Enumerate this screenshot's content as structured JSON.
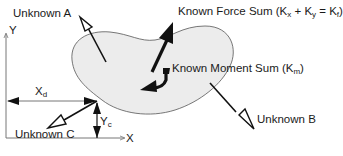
{
  "labels": {
    "unknown_a": "Unknown A",
    "unknown_b": "Unknown B",
    "unknown_c": "Unknown C",
    "known_force_prefix": "Known Force Sum (K",
    "known_force_sub_x": "x",
    "known_force_mid": " + K",
    "known_force_sub_y": "y",
    "known_force_eq": " = K",
    "known_force_sub_f": "f",
    "known_force_suffix": ")",
    "known_moment_prefix": "Known Moment Sum (K",
    "known_moment_sub": "m",
    "known_moment_suffix": ")",
    "x_axis": "X",
    "y_axis": "Y",
    "xd_main": "X",
    "xd_sub": "d",
    "yc_main": "Y",
    "yc_sub": "c"
  },
  "colors": {
    "body_fill": "#ececec",
    "stroke": "#111111",
    "axis": "#777777"
  }
}
